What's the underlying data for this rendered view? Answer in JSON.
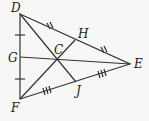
{
  "diagram": {
    "type": "triangle-medians",
    "stroke_color": "#333333",
    "background": "#f7f7f5",
    "labels": {
      "D": "D",
      "E": "E",
      "F": "F",
      "G": "G",
      "H": "H",
      "J": "J",
      "C": "C"
    },
    "points": {
      "D": [
        20,
        14
      ],
      "E": [
        130,
        64
      ],
      "F": [
        20,
        99
      ],
      "G": [
        20,
        57
      ],
      "H": [
        75,
        40
      ],
      "J": [
        76,
        82
      ],
      "C": [
        57,
        60
      ]
    },
    "segments": [
      "DE",
      "EF",
      "FD",
      "DJ",
      "FH",
      "GE"
    ],
    "tick_marks": {
      "DG_GF": 1,
      "DH_HE": 2,
      "EJ_JF": 3
    }
  }
}
